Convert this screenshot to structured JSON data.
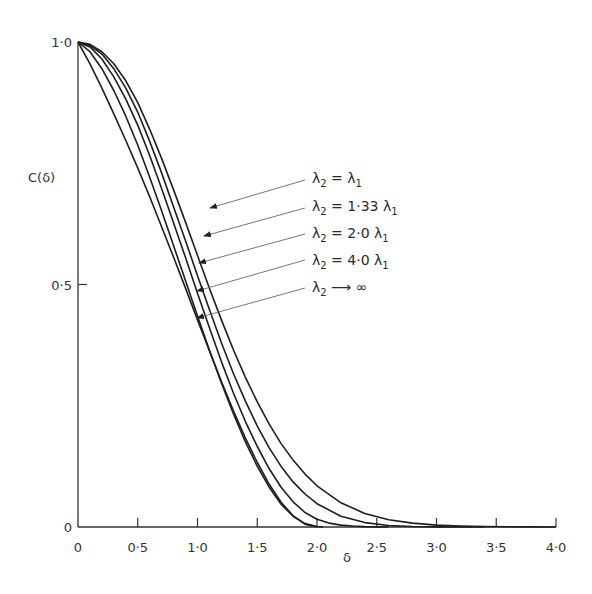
{
  "chart_data": {
    "type": "line",
    "title": "",
    "xlabel": "δ",
    "ylabel": "C(δ)",
    "xlim": [
      0,
      4.0
    ],
    "ylim": [
      0,
      1.0
    ],
    "grid": false,
    "legend_position": "inline-annotations-right",
    "x_ticks": [
      "0",
      "0·5",
      "1·0",
      "1·5",
      "2·0",
      "2·5",
      "3·0",
      "3·5",
      "4·0"
    ],
    "x_tick_values": [
      0,
      0.5,
      1.0,
      1.5,
      2.0,
      2.5,
      3.0,
      3.5,
      4.0
    ],
    "y_ticks": [
      "0",
      "0·5",
      "1·0"
    ],
    "y_tick_values": [
      0,
      0.5,
      1.0
    ],
    "series": [
      {
        "name": "λ2 = λ1",
        "label_main": "λ",
        "label_sub1": "2",
        "label_rel": " = λ",
        "label_sub2": "1",
        "x": [
          0,
          0.1,
          0.2,
          0.3,
          0.4,
          0.5,
          0.6,
          0.7,
          0.8,
          0.9,
          1.0,
          1.1,
          1.2,
          1.3,
          1.4,
          1.5,
          1.6,
          1.7,
          1.8,
          1.9,
          2.0,
          2.2,
          2.4,
          2.6,
          2.8,
          3.0,
          3.2,
          3.4,
          3.6,
          3.8,
          4.0
        ],
        "values": [
          1.0,
          0.995,
          0.98,
          0.955,
          0.92,
          0.875,
          0.82,
          0.76,
          0.695,
          0.628,
          0.56,
          0.492,
          0.427,
          0.366,
          0.309,
          0.258,
          0.212,
          0.172,
          0.138,
          0.109,
          0.085,
          0.05,
          0.028,
          0.015,
          0.008,
          0.004,
          0.002,
          0.001,
          0.0005,
          0.0002,
          0.0
        ]
      },
      {
        "name": "λ2 = 1·33 λ1",
        "label_main": "λ",
        "label_sub1": "2",
        "label_rel": " = 1·33 λ",
        "label_sub2": "1",
        "x": [
          0,
          0.1,
          0.2,
          0.3,
          0.4,
          0.5,
          0.6,
          0.7,
          0.8,
          0.9,
          1.0,
          1.1,
          1.2,
          1.3,
          1.4,
          1.5,
          1.6,
          1.7,
          1.8,
          1.9,
          2.0,
          2.2,
          2.4,
          2.6,
          2.8,
          3.0,
          3.2,
          3.4
        ],
        "values": [
          1.0,
          0.993,
          0.975,
          0.945,
          0.905,
          0.855,
          0.795,
          0.73,
          0.66,
          0.59,
          0.518,
          0.448,
          0.38,
          0.317,
          0.26,
          0.208,
          0.163,
          0.125,
          0.093,
          0.068,
          0.048,
          0.022,
          0.009,
          0.003,
          0.001,
          0.0003,
          0.0001,
          0.0
        ]
      },
      {
        "name": "λ2 = 2·0 λ1",
        "label_main": "λ",
        "label_sub1": "2",
        "label_rel": " = 2·0 λ",
        "label_sub2": "1",
        "x": [
          0,
          0.1,
          0.2,
          0.3,
          0.4,
          0.5,
          0.6,
          0.7,
          0.8,
          0.9,
          1.0,
          1.1,
          1.2,
          1.3,
          1.4,
          1.5,
          1.6,
          1.7,
          1.8,
          1.9,
          2.0,
          2.1,
          2.2,
          2.3,
          2.4,
          2.5,
          2.6
        ],
        "values": [
          1.0,
          0.99,
          0.965,
          0.928,
          0.882,
          0.828,
          0.766,
          0.698,
          0.627,
          0.555,
          0.482,
          0.41,
          0.341,
          0.277,
          0.218,
          0.166,
          0.12,
          0.082,
          0.052,
          0.03,
          0.016,
          0.008,
          0.004,
          0.002,
          0.0008,
          0.0003,
          0.0
        ]
      },
      {
        "name": "λ2 = 4·0 λ1",
        "label_main": "λ",
        "label_sub1": "2",
        "label_rel": " = 4·0 λ",
        "label_sub2": "1",
        "x": [
          0,
          0.1,
          0.2,
          0.3,
          0.4,
          0.5,
          0.6,
          0.7,
          0.8,
          0.9,
          1.0,
          1.1,
          1.2,
          1.3,
          1.4,
          1.5,
          1.6,
          1.7,
          1.8,
          1.9,
          2.0,
          2.05
        ],
        "values": [
          1.0,
          0.98,
          0.945,
          0.9,
          0.847,
          0.787,
          0.721,
          0.652,
          0.58,
          0.507,
          0.435,
          0.364,
          0.297,
          0.234,
          0.176,
          0.125,
          0.082,
          0.047,
          0.022,
          0.007,
          0.001,
          0.0
        ]
      },
      {
        "name": "λ2 → ∞",
        "label_main": "λ",
        "label_sub1": "2",
        "label_rel": " ⟶ ∞",
        "label_sub2": "",
        "x": [
          0,
          0.1,
          0.2,
          0.3,
          0.4,
          0.5,
          0.6,
          0.7,
          0.8,
          0.9,
          1.0,
          1.1,
          1.2,
          1.3,
          1.4,
          1.5,
          1.6,
          1.7,
          1.8,
          1.9,
          2.0
        ],
        "values": [
          1.0,
          0.955,
          0.905,
          0.852,
          0.797,
          0.74,
          0.681,
          0.619,
          0.556,
          0.492,
          0.427,
          0.363,
          0.3,
          0.24,
          0.184,
          0.133,
          0.088,
          0.051,
          0.023,
          0.006,
          0.0
        ]
      }
    ],
    "annotation_arrows": [
      {
        "series": "λ2 = λ1",
        "from": [
          305,
          180
        ],
        "to": [
          210,
          208
        ]
      },
      {
        "series": "λ2 = 1·33 λ1",
        "from": [
          305,
          208
        ],
        "to": [
          204,
          236
        ]
      },
      {
        "series": "λ2 = 2·0 λ1",
        "from": [
          305,
          234
        ],
        "to": [
          199,
          263
        ]
      },
      {
        "series": "λ2 = 4·0 λ1",
        "from": [
          305,
          260
        ],
        "to": [
          197,
          291
        ]
      },
      {
        "series": "λ2 → ∞",
        "from": [
          305,
          288
        ],
        "to": [
          197,
          318
        ]
      }
    ]
  },
  "axes": {
    "y_title": "C(δ)",
    "x_title": "δ"
  }
}
